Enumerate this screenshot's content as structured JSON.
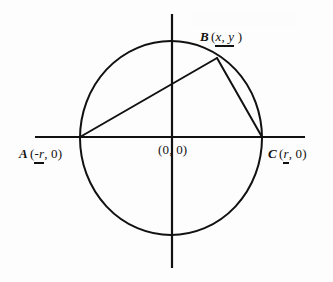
{
  "figure": {
    "background_color": "#fdfdfd",
    "stroke_color": "#111111"
  },
  "geometry": {
    "circle": {
      "center_px": [
        171,
        138
      ],
      "radius_x_px": 91,
      "radius_y_px": 97,
      "stroke_width": 2.0
    },
    "x_axis": {
      "from_px": [
        35,
        137
      ],
      "to_px": [
        305,
        137
      ],
      "stroke_width": 2.2
    },
    "y_axis": {
      "from_px": [
        172,
        14
      ],
      "to_px": [
        172,
        268
      ],
      "stroke_width": 2.2
    },
    "points": {
      "A": [
        80,
        137
      ],
      "B": [
        217,
        58
      ],
      "C": [
        262,
        137
      ],
      "O": [
        171,
        138
      ]
    },
    "segments": [
      {
        "name": "chord-ab",
        "from": "A",
        "to": "B"
      },
      {
        "name": "chord-bc",
        "from": "B",
        "to": "C"
      }
    ]
  },
  "labels": {
    "point_a": {
      "point": "A",
      "open_paren": "(",
      "coord_x": "-r",
      "comma": ", ",
      "coord_y": "0",
      "close_paren": ")",
      "underlined": "-r"
    },
    "point_b": {
      "point": "B",
      "open_paren": "(",
      "coord_x": "x",
      "comma": ", ",
      "coord_y": "y",
      "close_paren": " )",
      "underlined": "x, y"
    },
    "point_c": {
      "point": "C",
      "open_paren": "(",
      "coord_x": "r",
      "comma": ", ",
      "coord_y": "0",
      "close_paren": ")",
      "underlined": "r"
    },
    "origin": {
      "text": "(0, 0)",
      "underlined": ""
    }
  }
}
